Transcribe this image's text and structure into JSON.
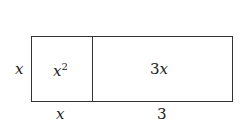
{
  "diagram": {
    "left_cell": {
      "label_base": "x",
      "label_exp": "2"
    },
    "right_cell": {
      "label_coef": "3",
      "label_var": "x"
    },
    "side_label": "x",
    "bottom_left_label": "x",
    "bottom_right_label": "3"
  }
}
